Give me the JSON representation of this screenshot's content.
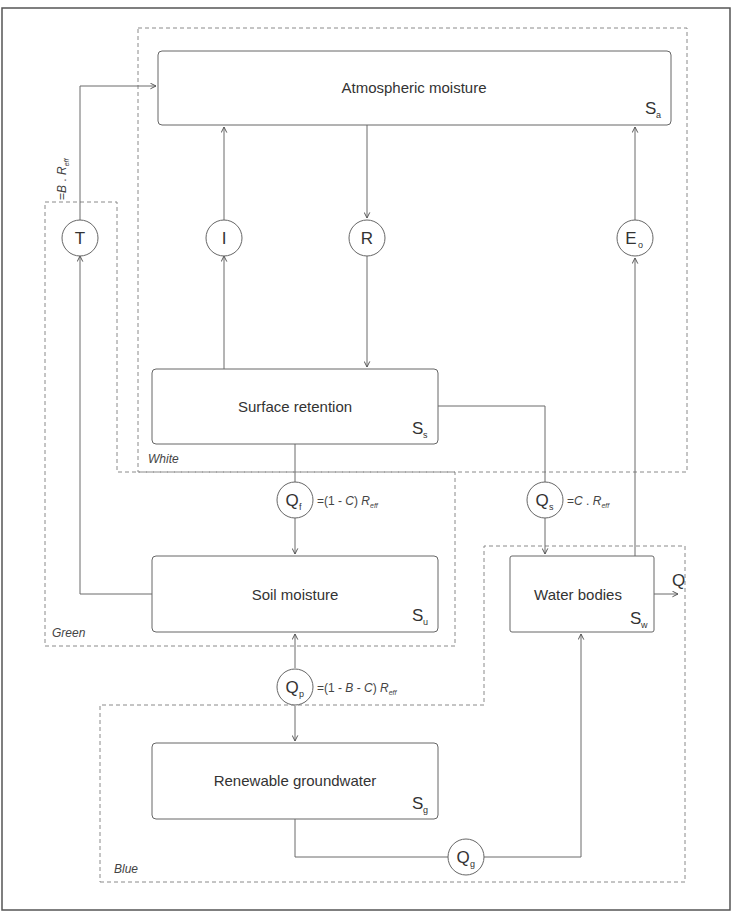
{
  "diagram": {
    "regions": {
      "white": {
        "label": "White"
      },
      "green": {
        "label": "Green"
      },
      "blue": {
        "label": "Blue"
      }
    },
    "stores": {
      "atmospheric": {
        "label": "Atmospheric moisture",
        "symbol": "S",
        "sub": "a"
      },
      "surface": {
        "label": "Surface retention",
        "symbol": "S",
        "sub": "s"
      },
      "soil": {
        "label": "Soil moisture",
        "symbol": "S",
        "sub": "u"
      },
      "water": {
        "label": "Water bodies",
        "symbol": "S",
        "sub": "w"
      },
      "groundwater": {
        "label": "Renewable groundwater",
        "symbol": "S",
        "sub": "g"
      }
    },
    "fluxes": {
      "T": {
        "symbol": "T",
        "sub": ""
      },
      "I": {
        "symbol": "I",
        "sub": ""
      },
      "R": {
        "symbol": "R",
        "sub": ""
      },
      "Eo": {
        "symbol": "E",
        "sub": "o"
      },
      "Qf": {
        "symbol": "Q",
        "sub": "f"
      },
      "Qs": {
        "symbol": "Q",
        "sub": "s"
      },
      "Qp": {
        "symbol": "Q",
        "sub": "p"
      },
      "Qg": {
        "symbol": "Q",
        "sub": "g"
      },
      "Q": {
        "symbol": "Q"
      }
    },
    "equations": {
      "T": {
        "prefix": "=",
        "a": "B",
        "mid": " . ",
        "r": "R",
        "rsub": "eff"
      },
      "Qf": {
        "prefix": "=(1 - ",
        "c": "C",
        "suffix": ")  ",
        "r": "R",
        "rsub": "eff"
      },
      "Qs": {
        "prefix": "=",
        "c": "C",
        "mid": " . ",
        "r": "R",
        "rsub": "eff"
      },
      "Qp": {
        "prefix": "=(1 - ",
        "b": "B",
        "mid": " - ",
        "c": "C",
        "suffix": ")  ",
        "r": "R",
        "rsub": "eff"
      }
    },
    "colors": {
      "line": "#6a6a6a",
      "dash": "#8a8a8a",
      "border": "#555555",
      "text": "#333333"
    }
  }
}
